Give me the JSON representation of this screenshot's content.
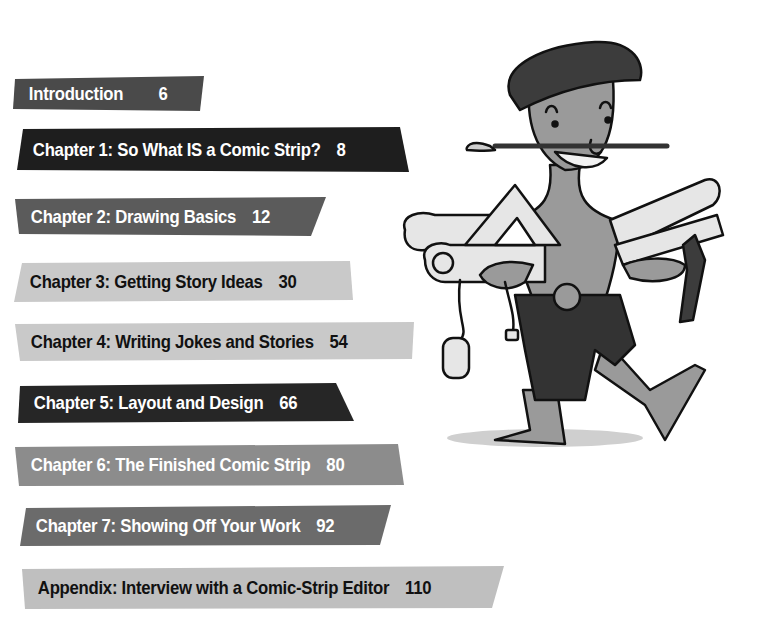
{
  "toc": {
    "entries": [
      {
        "id": "intro",
        "label": "Introduction",
        "page": "6",
        "fill": "#4a4a4a",
        "tone": "dark"
      },
      {
        "id": "ch1",
        "label": "Chapter 1: So What IS a Comic Strip?",
        "page": "8",
        "fill": "#1e1e1e",
        "tone": "dark"
      },
      {
        "id": "ch2",
        "label": "Chapter 2: Drawing Basics",
        "page": "12",
        "fill": "#5b5b5b",
        "tone": "dark"
      },
      {
        "id": "ch3",
        "label": "Chapter 3: Getting Story Ideas",
        "page": "30",
        "fill": "#c9c9c9",
        "tone": "light"
      },
      {
        "id": "ch4",
        "label": "Chapter 4: Writing Jokes and Stories",
        "page": "54",
        "fill": "#c9c9c9",
        "tone": "light"
      },
      {
        "id": "ch5",
        "label": "Chapter 5: Layout and Design",
        "page": "66",
        "fill": "#262626",
        "tone": "dark"
      },
      {
        "id": "ch6",
        "label": "Chapter 6: The Finished Comic Strip",
        "page": "80",
        "fill": "#8c8c8c",
        "tone": "dark"
      },
      {
        "id": "ch7",
        "label": "Chapter 7: Showing Off Your Work",
        "page": "92",
        "fill": "#6b6b6b",
        "tone": "dark"
      },
      {
        "id": "app",
        "label": "Appendix: Interview with a Comic-Strip Editor",
        "page": "110",
        "fill": "#bfbfbf",
        "tone": "light"
      }
    ]
  },
  "illustration": {
    "subject": "cartoon artist in beret with paintbrush in mouth carrying scrolls, rulers, triangle, T-square and computer mouse",
    "colors": {
      "skin": "#9a9a9a",
      "beret": "#3c3c3c",
      "shorts": "#333333",
      "paper": "#e6e6e6",
      "outline": "#111111"
    }
  }
}
